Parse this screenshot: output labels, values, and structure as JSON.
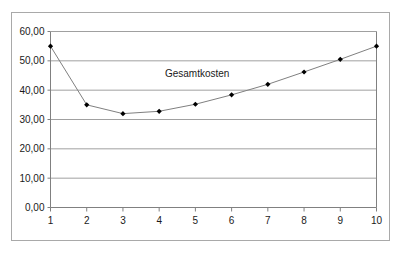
{
  "chart_data": {
    "type": "line",
    "title": "",
    "subtitle": "",
    "xlabel": "",
    "ylabel": "",
    "x": [
      1,
      2,
      3,
      4,
      5,
      6,
      7,
      8,
      9,
      10
    ],
    "categories": [
      "1",
      "2",
      "3",
      "4",
      "5",
      "6",
      "7",
      "8",
      "9",
      "10"
    ],
    "series": [
      {
        "name": "Gesamtkosten",
        "values": [
          55.0,
          35.0,
          32.0,
          32.8,
          35.2,
          38.4,
          42.0,
          46.2,
          50.5,
          55.0
        ],
        "marker": "diamond",
        "marker_color": "#000000",
        "line_color": "#808080"
      }
    ],
    "annotations": [
      {
        "text": "Gesamtkosten",
        "x": 5.05,
        "y": 44.5
      }
    ],
    "xlim": [
      1,
      10
    ],
    "ylim": [
      0,
      60
    ],
    "x_ticks": [
      1,
      2,
      3,
      4,
      5,
      6,
      7,
      8,
      9,
      10
    ],
    "x_tick_labels": [
      "1",
      "2",
      "3",
      "4",
      "5",
      "6",
      "7",
      "8",
      "9",
      "10"
    ],
    "y_ticks": [
      0,
      10,
      20,
      30,
      40,
      50,
      60
    ],
    "y_tick_labels": [
      "0,00",
      "10,00",
      "20,00",
      "30,00",
      "40,00",
      "50,00",
      "60,00"
    ],
    "grid": {
      "horizontal": true,
      "vertical": false,
      "color": "#a0a0a0"
    },
    "legend": {
      "visible": false,
      "position": "none"
    },
    "colors": {
      "frame": "#a9a9a9",
      "axis": "#808080",
      "gridline": "#a0a0a0",
      "line": "#808080",
      "marker": "#000000",
      "text": "#1a1a1a",
      "background": "#ffffff"
    }
  }
}
